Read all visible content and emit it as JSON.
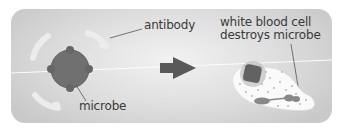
{
  "diagram": {
    "title": "",
    "labels": {
      "antibody": "antibody",
      "microbe": "microbe",
      "wbc_line1": "white blood cell",
      "wbc_line2": "destroys microbe"
    },
    "elements": [
      {
        "id": "antibody",
        "icon": "antibody-arcs",
        "count": 4
      },
      {
        "id": "microbe",
        "icon": "microbe-blob"
      },
      {
        "id": "arrow",
        "icon": "arrow-right-icon"
      },
      {
        "id": "white-blood-cell",
        "icon": "white-blood-cell-engulfing-microbe"
      }
    ],
    "colors": {
      "panel_center": "#f2f2f2",
      "panel_edge": "#c9c9c9",
      "microbe": "#6f6f6f",
      "arrow": "#5a5a5a",
      "antibody": "#ebebeb",
      "cell_body": "#fafafa",
      "text": "#3a3a3a"
    }
  }
}
